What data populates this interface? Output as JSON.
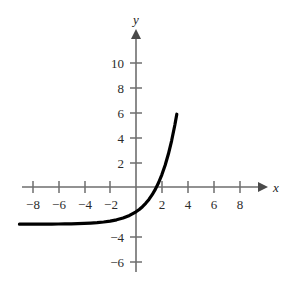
{
  "chart_data": {
    "type": "line",
    "title": "",
    "subtitle": "",
    "xlabel": "x",
    "ylabel": "y",
    "xlim": [
      -9.2,
      9.8
    ],
    "ylim": [
      -7.4,
      11.6
    ],
    "grid": false,
    "legend": null,
    "x_ticks": [
      -8,
      -6,
      -4,
      -2,
      2,
      4,
      6,
      8
    ],
    "x_tick_labels": [
      "−8",
      "−6",
      "−4",
      "−2",
      "2",
      "4",
      "6",
      "8"
    ],
    "y_ticks": [
      10,
      8,
      6,
      4,
      2,
      -4,
      -6
    ],
    "y_tick_labels": [
      "10",
      "8",
      "6",
      "4",
      "2",
      "−4",
      "−6"
    ],
    "asymptote": -3,
    "series": [
      {
        "name": "y = 2^x - 3",
        "x": [
          -9.0,
          -8.5,
          -8.0,
          -7.5,
          -7.0,
          -6.5,
          -6.0,
          -5.5,
          -5.0,
          -4.5,
          -4.0,
          -3.5,
          -3.0,
          -2.5,
          -2.0,
          -1.5,
          -1.0,
          -0.5,
          0.0,
          0.25,
          0.5,
          0.75,
          1.0,
          1.25,
          1.5,
          1.75,
          2.0,
          2.25,
          2.5,
          2.75,
          3.0,
          3.15
        ],
        "values": [
          -2.998,
          -2.997,
          -2.996,
          -2.995,
          -2.992,
          -2.989,
          -2.984,
          -2.978,
          -2.969,
          -2.956,
          -2.938,
          -2.912,
          -2.875,
          -2.823,
          -2.75,
          -2.646,
          -2.5,
          -2.293,
          -2.0,
          -1.811,
          -1.586,
          -1.318,
          -1.0,
          -0.622,
          -0.172,
          0.363,
          1.0,
          1.757,
          2.657,
          3.727,
          5.0,
          5.87
        ]
      }
    ],
    "annotations": []
  },
  "figure": {
    "background_color": "#ffffff",
    "curve_color": "#000000",
    "axis_color": "#6e6e6e",
    "text_color": "#2b2b2b",
    "x_axis_label": "x",
    "y_axis_label": "y"
  }
}
